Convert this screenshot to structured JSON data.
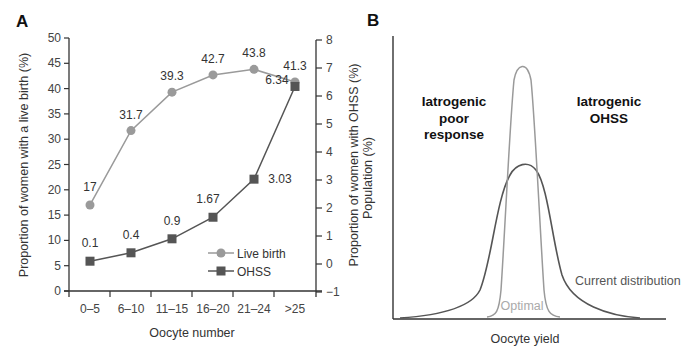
{
  "chart_data": [
    {
      "panel": "A",
      "type": "line",
      "xlabel": "Oocyte number",
      "categories": [
        "0–5",
        "6–10",
        "11–15",
        "16–20",
        "21–24",
        ">25"
      ],
      "y_left": {
        "label": "Proportion of women with a live birth (%)",
        "range": [
          0,
          50
        ],
        "ticks": [
          0,
          5,
          10,
          15,
          20,
          25,
          30,
          35,
          40,
          45,
          50
        ]
      },
      "y_right": {
        "label": "Proportion of women with OHSS (%)",
        "range": [
          -1,
          8
        ],
        "ticks": [
          -1,
          0,
          1,
          2,
          3,
          4,
          5,
          6,
          7,
          8
        ]
      },
      "series": [
        {
          "name": "Live birth",
          "axis": "left",
          "marker": "circle",
          "color": "#9a9a9a",
          "values": [
            17,
            31.7,
            39.3,
            42.7,
            43.8,
            41.3
          ],
          "labels": [
            "17",
            "31.7",
            "39.3",
            "42.7",
            "43.8",
            "41.3"
          ]
        },
        {
          "name": "OHSS",
          "axis": "right",
          "marker": "square",
          "color": "#555555",
          "values": [
            0.1,
            0.4,
            0.9,
            1.67,
            3.03,
            6.34
          ],
          "labels": [
            "0.1",
            "0.4",
            "0.9",
            "1.67",
            "3.03",
            "6.34"
          ]
        }
      ],
      "legend": {
        "position": "lower right",
        "entries": [
          "Live birth",
          "OHSS"
        ]
      },
      "grid": false
    },
    {
      "panel": "B",
      "type": "line",
      "xlabel": "Oocyte yield",
      "ylabel": "Population (%)",
      "series": [
        {
          "name": "Optimal",
          "color": "#9a9a9a",
          "shape": "narrow tall distribution"
        },
        {
          "name": "Current distribution",
          "color": "#555555",
          "shape": "wide distribution with long tails"
        }
      ],
      "annotations": [
        "Iatrogenic poor response",
        "Iatrogenic OHSS",
        "Optimal",
        "Current distribution"
      ],
      "grid": false
    }
  ],
  "panelA": {
    "label": "A",
    "xlabel": "Oocyte number",
    "ylabel_left": "Proportion of women with a live birth (%)",
    "ylabel_right": "Proportion of women with OHSS (%)",
    "left_ticks": [
      "0",
      "5",
      "10",
      "15",
      "20",
      "25",
      "30",
      "35",
      "40",
      "45",
      "50"
    ],
    "right_ticks": [
      "−1",
      "0",
      "1",
      "2",
      "3",
      "4",
      "5",
      "6",
      "7",
      "8"
    ],
    "categories": [
      "0–5",
      "6–10",
      "11–15",
      "16–20",
      "21–24",
      ">25"
    ],
    "live_labels": [
      "17",
      "31.7",
      "39.3",
      "42.7",
      "43.8",
      "41.3"
    ],
    "ohss_labels": [
      "0.1",
      "0.4",
      "0.9",
      "1.67",
      "3.03",
      "6.34"
    ],
    "legend": {
      "live": "Live birth",
      "ohss": "OHSS"
    }
  },
  "panelB": {
    "label": "B",
    "xlabel": "Oocyte yield",
    "ylabel": "Population (%)",
    "poor_response": [
      "Iatrogenic",
      "poor",
      "response"
    ],
    "ohss": [
      "Iatrogenic",
      "OHSS"
    ],
    "optimal": "Optimal",
    "current": "Current distribution"
  },
  "colors": {
    "live": "#9a9a9a",
    "ohss": "#555555",
    "axis": "#333333"
  }
}
